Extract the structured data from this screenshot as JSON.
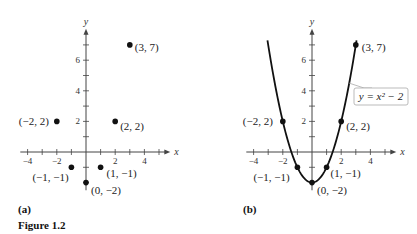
{
  "figure_caption": "Figure 1.2",
  "chart_data": [
    {
      "type": "scatter",
      "panel_label": "(a)",
      "xlabel": "x",
      "ylabel": "y",
      "xlim": [
        -4.5,
        5.5
      ],
      "ylim": [
        -2.5,
        7.8
      ],
      "x_tick_labels": [
        "-4",
        "-2",
        "2",
        "4"
      ],
      "x_ticks": [
        -4,
        -2,
        2,
        4
      ],
      "y_tick_labels": [
        "2",
        "4",
        "6"
      ],
      "y_ticks": [
        2,
        4,
        6
      ],
      "grid": false,
      "points": [
        {
          "x": -2,
          "y": 2,
          "label": "(−2, 2)"
        },
        {
          "x": -1,
          "y": -1,
          "label": "(−1, −1)"
        },
        {
          "x": 0,
          "y": -2,
          "label": "(0, −2)"
        },
        {
          "x": 1,
          "y": -1,
          "label": "(1, −1)"
        },
        {
          "x": 2,
          "y": 2,
          "label": "(2, 2)"
        },
        {
          "x": 3,
          "y": 7,
          "label": "(3, 7)"
        }
      ]
    },
    {
      "type": "line",
      "panel_label": "(b)",
      "xlabel": "x",
      "ylabel": "y",
      "xlim": [
        -4.5,
        5.5
      ],
      "ylim": [
        -2.5,
        7.8
      ],
      "x_tick_labels": [
        "-4",
        "-2",
        "2",
        "4"
      ],
      "x_ticks": [
        -4,
        -2,
        2,
        4
      ],
      "y_tick_labels": [
        "2",
        "4",
        "6"
      ],
      "y_ticks": [
        2,
        4,
        6
      ],
      "grid": false,
      "curve_label": "y = x² − 2",
      "curve_domain": [
        -3.05,
        3.05
      ],
      "points": [
        {
          "x": -2,
          "y": 2,
          "label": "(−2, 2)"
        },
        {
          "x": -1,
          "y": -1,
          "label": "(−1, −1)"
        },
        {
          "x": 0,
          "y": -2,
          "label": "(0, −2)"
        },
        {
          "x": 1,
          "y": -1,
          "label": "(1, −1)"
        },
        {
          "x": 2,
          "y": 2,
          "label": "(2, 2)"
        },
        {
          "x": 3,
          "y": 7,
          "label": "(3, 7)"
        }
      ]
    }
  ]
}
